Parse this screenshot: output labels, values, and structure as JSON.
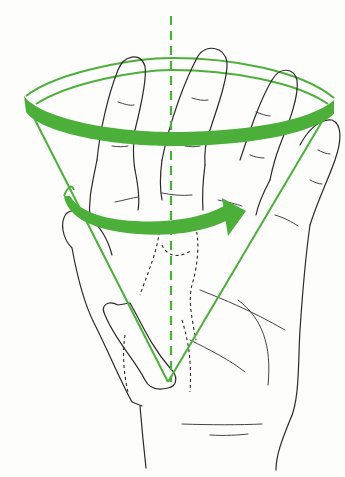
{
  "figure": {
    "colors": {
      "accent": "#4caf3a",
      "line": "#2a2a2a",
      "background": "#fdfdfb"
    },
    "elements": [
      {
        "name": "axis-line",
        "style": "dashed",
        "color": "#4caf3a"
      },
      {
        "name": "cone-outline",
        "style": "solid",
        "color": "#4caf3a"
      },
      {
        "name": "cone-rim-band",
        "style": "thick band",
        "color": "#4caf3a"
      },
      {
        "name": "rotation-arrow",
        "style": "thick curved arrow",
        "direction": "left-to-right",
        "color": "#4caf3a"
      },
      {
        "name": "hand-outline",
        "style": "line drawing",
        "color": "#2a2a2a"
      },
      {
        "name": "hidden-bones",
        "style": "dashed",
        "color": "#2a2a2a"
      }
    ]
  }
}
